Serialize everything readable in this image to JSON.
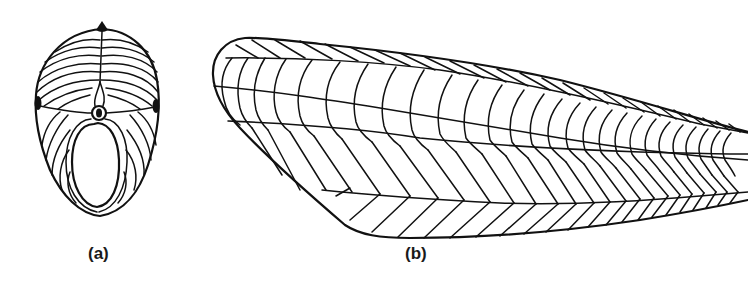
{
  "figure": {
    "panels": [
      {
        "id": "a",
        "label": "(a)",
        "description": "Transverse cross-section of fish body showing myomere musculature"
      },
      {
        "id": "b",
        "label": "(b)",
        "description": "Lateral view of fish body showing chevron-shaped myomeres"
      }
    ],
    "colors": {
      "line": "#111111",
      "background": "#ffffff"
    }
  }
}
